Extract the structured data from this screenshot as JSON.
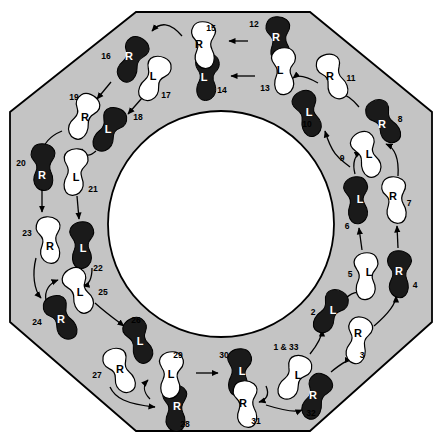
{
  "diagram": {
    "shape": "octagon",
    "colors": {
      "floor": "#c4c4c4",
      "floor_outline": "#000000",
      "inner_circle": "#ffffff",
      "foot_dark": "#1a1a1a",
      "foot_light": "#ffffff",
      "arrow": "#000000",
      "page_background": "#ffffff"
    },
    "geometry": {
      "width": 441,
      "height": 448,
      "octagon_points": "136,12 310,12 432,112 432,322 310,431 136,431 10,322 10,112",
      "inner_circle_cx": 221,
      "inner_circle_cy": 224,
      "inner_circle_r": 113
    },
    "legend": {
      "left_foot_label": "L",
      "right_foot_label": "R",
      "dark_means": "filled footprint",
      "light_means": "outline footprint"
    },
    "steps": [
      {
        "num": "1 & 33",
        "foot": "L",
        "fill": "light",
        "x": 295,
        "y": 378,
        "rot": 25,
        "label_x": 298,
        "label_y": 375,
        "num_x": 286,
        "num_y": 347
      },
      {
        "num": "2",
        "foot": "L",
        "fill": "dark",
        "x": 331,
        "y": 312,
        "rot": 28,
        "label_x": 333,
        "label_y": 310,
        "num_x": 313,
        "num_y": 312
      },
      {
        "num": "3",
        "foot": "R",
        "fill": "light",
        "x": 357,
        "y": 340,
        "rot": 14,
        "label_x": 358,
        "label_y": 333,
        "num_x": 362,
        "num_y": 355
      },
      {
        "num": "4",
        "foot": "R",
        "fill": "dark",
        "x": 398,
        "y": 274,
        "rot": 4,
        "label_x": 399,
        "label_y": 271,
        "num_x": 415,
        "num_y": 285
      },
      {
        "num": "5",
        "foot": "L",
        "fill": "light",
        "x": 367,
        "y": 276,
        "rot": -2,
        "label_x": 369,
        "label_y": 272,
        "num_x": 350,
        "num_y": 274
      },
      {
        "num": "6",
        "foot": "L",
        "fill": "dark",
        "x": 358,
        "y": 200,
        "rot": -8,
        "label_x": 360,
        "label_y": 199,
        "num_x": 347,
        "num_y": 226
      },
      {
        "num": "7",
        "foot": "R",
        "fill": "light",
        "x": 394,
        "y": 200,
        "rot": -4,
        "label_x": 393,
        "label_y": 196,
        "num_x": 409,
        "num_y": 203
      },
      {
        "num": "8",
        "foot": "R",
        "fill": "dark",
        "x": 383,
        "y": 122,
        "rot": -28,
        "label_x": 382,
        "label_y": 124,
        "num_x": 400,
        "num_y": 119
      },
      {
        "num": "9",
        "foot": "L",
        "fill": "light",
        "x": 368,
        "y": 154,
        "rot": -23,
        "label_x": 369,
        "label_y": 154,
        "num_x": 342,
        "num_y": 158
      },
      {
        "num": "10",
        "foot": "L",
        "fill": "dark",
        "x": 309,
        "y": 113,
        "rot": -20,
        "label_x": 309,
        "label_y": 112,
        "num_x": 307,
        "num_y": 124
      },
      {
        "num": "11",
        "foot": "R",
        "fill": "light",
        "x": 332,
        "y": 77,
        "rot": -20,
        "label_x": 330,
        "label_y": 76,
        "num_x": 351,
        "num_y": 78
      },
      {
        "num": "12",
        "foot": "R",
        "fill": "dark",
        "x": 278,
        "y": 40,
        "rot": -3,
        "label_x": 276,
        "label_y": 37,
        "num_x": 254,
        "num_y": 24
      },
      {
        "num": "13",
        "foot": "L",
        "fill": "light",
        "x": 285,
        "y": 71,
        "rot": -4,
        "label_x": 280,
        "label_y": 70,
        "num_x": 265,
        "num_y": 88
      },
      {
        "num": "14",
        "foot": "L",
        "fill": "dark",
        "x": 208,
        "y": 77,
        "rot": 0,
        "label_x": 204,
        "label_y": 77,
        "num_x": 222,
        "num_y": 90
      },
      {
        "num": "15",
        "foot": "R",
        "fill": "light",
        "x": 203,
        "y": 45,
        "rot": 0,
        "label_x": 199,
        "label_y": 44,
        "num_x": 211,
        "num_y": 28
      },
      {
        "num": "16",
        "foot": "R",
        "fill": "dark",
        "x": 131,
        "y": 59,
        "rot": 26,
        "label_x": 129,
        "label_y": 56,
        "num_x": 106,
        "num_y": 56
      },
      {
        "num": "17",
        "foot": "L",
        "fill": "light",
        "x": 155,
        "y": 79,
        "rot": 22,
        "label_x": 153,
        "label_y": 76,
        "num_x": 166,
        "num_y": 95
      },
      {
        "num": "18",
        "foot": "L",
        "fill": "dark",
        "x": 110,
        "y": 130,
        "rot": 25,
        "label_x": 108,
        "label_y": 129,
        "num_x": 138,
        "num_y": 117
      },
      {
        "num": "19",
        "foot": "R",
        "fill": "light",
        "x": 82,
        "y": 116,
        "rot": 25,
        "label_x": 85,
        "label_y": 117,
        "num_x": 74,
        "num_y": 97
      },
      {
        "num": "20",
        "foot": "R",
        "fill": "dark",
        "x": 42,
        "y": 167,
        "rot": 2,
        "label_x": 42,
        "label_y": 175,
        "num_x": 21,
        "num_y": 163
      },
      {
        "num": "21",
        "foot": "L",
        "fill": "light",
        "x": 76,
        "y": 172,
        "rot": 3,
        "label_x": 76,
        "label_y": 177,
        "num_x": 93,
        "num_y": 189
      },
      {
        "num": "22",
        "foot": "L",
        "fill": "dark",
        "x": 83,
        "y": 245,
        "rot": -3,
        "label_x": 83,
        "label_y": 248,
        "num_x": 98,
        "num_y": 268
      },
      {
        "num": "23",
        "foot": "R",
        "fill": "light",
        "x": 48,
        "y": 240,
        "rot": -2,
        "label_x": 50,
        "label_y": 246,
        "num_x": 27,
        "num_y": 233
      },
      {
        "num": "24",
        "foot": "R",
        "fill": "dark",
        "x": 60,
        "y": 318,
        "rot": -25,
        "label_x": 61,
        "label_y": 319,
        "num_x": 37,
        "num_y": 322
      },
      {
        "num": "25",
        "foot": "L",
        "fill": "light",
        "x": 80,
        "y": 290,
        "rot": -25,
        "label_x": 80,
        "label_y": 292,
        "num_x": 103,
        "num_y": 292
      },
      {
        "num": "26",
        "foot": "L",
        "fill": "dark",
        "x": 140,
        "y": 340,
        "rot": -22,
        "label_x": 140,
        "label_y": 341,
        "num_x": 136,
        "num_y": 320
      },
      {
        "num": "27",
        "foot": "R",
        "fill": "light",
        "x": 119,
        "y": 371,
        "rot": -22,
        "label_x": 120,
        "label_y": 369,
        "num_x": 97,
        "num_y": 375
      },
      {
        "num": "28",
        "foot": "R",
        "fill": "dark",
        "x": 174,
        "y": 408,
        "rot": 1,
        "label_x": 177,
        "label_y": 406,
        "num_x": 185,
        "num_y": 424
      },
      {
        "num": "29",
        "foot": "L",
        "fill": "light",
        "x": 172,
        "y": 375,
        "rot": 0,
        "label_x": 171,
        "label_y": 374,
        "num_x": 178,
        "num_y": 355
      },
      {
        "num": "30",
        "foot": "L",
        "fill": "dark",
        "x": 240,
        "y": 372,
        "rot": 1,
        "label_x": 242,
        "label_y": 371,
        "num_x": 224,
        "num_y": 355
      },
      {
        "num": "31",
        "foot": "R",
        "fill": "light",
        "x": 245,
        "y": 404,
        "rot": -2,
        "label_x": 243,
        "label_y": 403,
        "num_x": 256,
        "num_y": 421
      },
      {
        "num": "32",
        "foot": "R",
        "fill": "dark",
        "x": 315,
        "y": 396,
        "rot": 24,
        "label_x": 313,
        "label_y": 395,
        "num_x": 311,
        "num_y": 413
      }
    ],
    "arrows": [
      {
        "from": "12",
        "to": "15",
        "d": "M 248 41 L 229 41"
      },
      {
        "from": "13",
        "to": "14",
        "d": "M 255 76 L 231 76"
      },
      {
        "from": "15",
        "to": "16",
        "d": "M 182 36 C 170 22 160 22 152 31"
      },
      {
        "from": "11",
        "to": "13",
        "d": "M 318 83 C 306 76 298 74 293 78"
      },
      {
        "from": "8",
        "to": "11",
        "d": "M 359 107 C 350 96 343 92 337 96"
      },
      {
        "from": "7",
        "to": "8",
        "d": "M 398 176 C 399 160 395 148 386 144"
      },
      {
        "from": "9",
        "to": "10",
        "d": "M 350 167 C 342 160 333 158 325 131"
      },
      {
        "from": "6",
        "to": "9",
        "d": "M 355 174 C 352 163 355 155 361 152"
      },
      {
        "from": "5",
        "to": "6",
        "d": "M 362 250 L 359 228"
      },
      {
        "from": "4",
        "to": "7",
        "d": "M 398 248 L 397 226"
      },
      {
        "from": "3",
        "to": "4",
        "d": "M 374 326 C 388 314 396 304 396 296"
      },
      {
        "from": "2",
        "to": "5",
        "d": "M 346 298 C 355 290 360 292 364 295"
      },
      {
        "from": "1",
        "to": "2",
        "d": "M 310 354 C 318 344 322 336 322 330"
      },
      {
        "from": "32",
        "to": "3",
        "d": "M 331 372 C 343 362 348 360 351 360"
      },
      {
        "from": "31",
        "to": "32",
        "d": "M 266 405 C 285 411 297 412 302 410"
      },
      {
        "from": "30",
        "to": "31",
        "d": "M 266 386 C 270 395 266 400 259 402"
      },
      {
        "from": "29",
        "to": "30",
        "d": "M 196 373 L 218 373"
      },
      {
        "from": "28",
        "to": "29",
        "d": "M 150 399 C 143 392 143 385 148 380"
      },
      {
        "from": "27",
        "to": "28",
        "d": "M 110 387 C 115 398 126 404 155 407"
      },
      {
        "from": "26",
        "to": "27",
        "d": "M 122 356 C 116 360 114 364 116 368"
      },
      {
        "from": "25",
        "to": "26",
        "d": "M 95 303 C 106 313 116 320 124 326"
      },
      {
        "from": "24",
        "to": "25",
        "d": "M 46 301 C 44 290 50 283 58 280"
      },
      {
        "from": "23",
        "to": "24",
        "d": "M 36 258 C 32 274 34 290 41 298"
      },
      {
        "from": "22",
        "to": "25",
        "d": "M 92 268 C 92 280 88 285 83 286"
      },
      {
        "from": "20",
        "to": "23",
        "d": "M 42 190 L 42 212"
      },
      {
        "from": "21",
        "to": "22",
        "d": "M 77 196 L 79 219"
      },
      {
        "from": "19",
        "to": "20",
        "d": "M 62 131 C 50 136 43 144 42 154"
      },
      {
        "from": "18",
        "to": "21",
        "d": "M 96 151 C 88 158 84 155 82 149"
      },
      {
        "from": "16",
        "to": "19",
        "d": "M 111 82 L 97 99"
      },
      {
        "from": "17",
        "to": "18",
        "d": "M 142 98 L 128 114"
      }
    ]
  }
}
